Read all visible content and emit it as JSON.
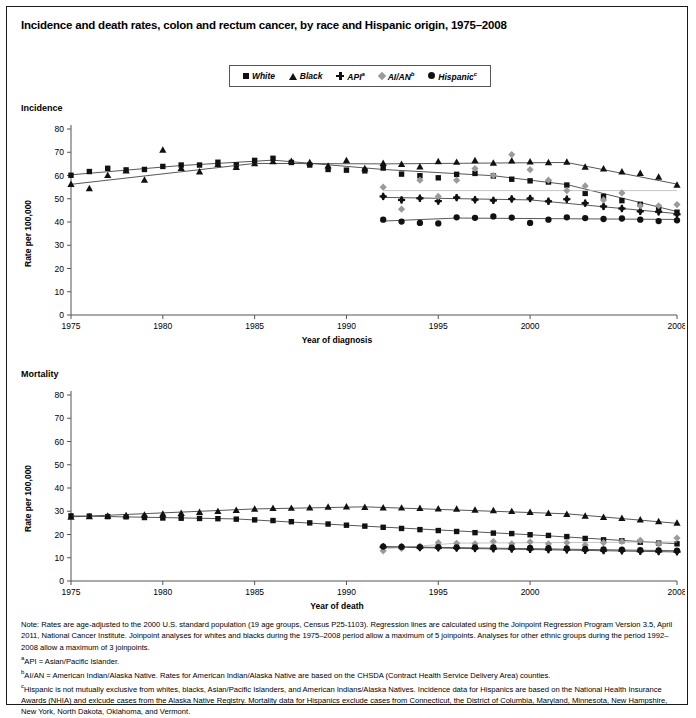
{
  "title": "Incidence and death rates, colon and rectum cancer, by race and Hispanic origin, 1975–2008",
  "legend": {
    "items": [
      {
        "label": "White",
        "sup": "",
        "marker": "square",
        "color": "#111111"
      },
      {
        "label": "Black",
        "sup": "",
        "marker": "triangle",
        "color": "#111111"
      },
      {
        "label": "API",
        "sup": "a",
        "marker": "plus",
        "color": "#111111"
      },
      {
        "label": "AI/AN",
        "sup": "b",
        "marker": "diamond",
        "color": "#9a9a9a"
      },
      {
        "label": "Hispanic",
        "sup": "c",
        "marker": "circle",
        "color": "#111111"
      }
    ]
  },
  "panels": {
    "incidence_label": "Incidence",
    "mortality_label": "Mortality",
    "ylabel": "Rate per 100,000",
    "xlabel_incidence": "Year of diagnosis",
    "xlabel_mortality": "Year of death"
  },
  "notes": {
    "note": "Note: Rates are age-adjusted to the 2000 U.S. standard population (19 age groups, Census P25-1103). Regression lines are calculated using the Joinpoint Regression Program Version 3.5, April 2011, National Cancer Institute. Joinpoint analyses for whites and blacks during the 1975–2008 period allow a maximum of 5 joinpoints. Analyses for other ethnic groups during the period 1992–2008 allow a maximum of 3 joinpoints.",
    "footnote_a_marker": "a",
    "footnote_a": "API = Asian/Pacific Islander.",
    "footnote_b_marker": "b",
    "footnote_b": "AI/AN = American Indian/Alaska Native. Rates for American Indian/Alaska Native are based on the CHSDA (Contract Health Service Delivery Area) counties.",
    "footnote_c_marker": "c",
    "footnote_c": "Hispanic is not mutually exclusive from whites, blacks, Asian/Pacific Islanders, and American Indians/Alaska Natives. Incidence data for Hispanics are based on the National Health Insurance Awards (NHIA) and exlcude cases from the Alaska Native Registry. Mortality data for Hispanics exclude cases from Connecticut, the District of Columbia, Maryland, Minnesota, New Hampshire, New York, North Dakota, Oklahoma, and Vermont."
  },
  "chart_data": [
    {
      "type": "line",
      "title": "Incidence",
      "xlabel": "Year of diagnosis",
      "ylabel": "Rate per 100,000",
      "xlim": [
        1975,
        2008
      ],
      "ylim": [
        0,
        80
      ],
      "yticks": [
        0,
        10,
        20,
        30,
        40,
        50,
        60,
        70,
        80
      ],
      "xticks": [
        1975,
        1980,
        1985,
        1990,
        1995,
        2000,
        2008
      ],
      "grid": false,
      "legend_position": "top-center",
      "series": [
        {
          "name": "White",
          "marker": "square",
          "color": "#111111",
          "x": [
            1975,
            1976,
            1977,
            1978,
            1979,
            1980,
            1981,
            1982,
            1983,
            1984,
            1985,
            1986,
            1987,
            1988,
            1989,
            1990,
            1991,
            1992,
            1993,
            1994,
            1995,
            1996,
            1997,
            1998,
            1999,
            2000,
            2001,
            2002,
            2003,
            2004,
            2005,
            2006,
            2007,
            2008
          ],
          "y": [
            60.1,
            61.7,
            63.1,
            62.4,
            62.6,
            63.9,
            64.5,
            64.5,
            65.7,
            64.6,
            66.5,
            67.4,
            65.6,
            64.5,
            62.6,
            62.3,
            62.0,
            63.2,
            60.6,
            59.9,
            59.0,
            60.5,
            60.9,
            59.8,
            58.4,
            57.7,
            57.2,
            55.9,
            52.3,
            51.0,
            49.2,
            47.6,
            46.0,
            44.2
          ],
          "fit": [
            [
              1975,
              60.3
            ],
            [
              1981,
              64.3
            ],
            [
              1986,
              66.6
            ],
            [
              1992,
              62.6
            ],
            [
              1998,
              59.9
            ],
            [
              2002,
              56.1
            ],
            [
              2008,
              44.5
            ]
          ]
        },
        {
          "name": "Black",
          "marker": "triangle",
          "color": "#111111",
          "x": [
            1975,
            1976,
            1977,
            1978,
            1979,
            1980,
            1981,
            1982,
            1983,
            1984,
            1985,
            1986,
            1987,
            1988,
            1989,
            1990,
            1991,
            1992,
            1993,
            1994,
            1995,
            1996,
            1997,
            1998,
            1999,
            2000,
            2001,
            2002,
            2003,
            2004,
            2005,
            2006,
            2007,
            2008
          ],
          "y": [
            56.3,
            54.5,
            60.1,
            62.1,
            58.1,
            71.0,
            63.2,
            61.7,
            64.9,
            63.6,
            65.2,
            66.1,
            66.2,
            65.6,
            64.2,
            66.5,
            63.1,
            65.3,
            64.9,
            63.8,
            66.1,
            65.8,
            66.5,
            65.4,
            66.4,
            66.0,
            65.6,
            65.9,
            63.7,
            63.0,
            61.7,
            61.0,
            59.4,
            56.0
          ],
          "fit": [
            [
              1975,
              56.2
            ],
            [
              1985,
              65.2
            ],
            [
              1992,
              65.0
            ],
            [
              2002,
              65.6
            ],
            [
              2008,
              56.3
            ]
          ]
        },
        {
          "name": "API",
          "marker": "plus",
          "color": "#111111",
          "x": [
            1992,
            1993,
            1994,
            1995,
            1996,
            1997,
            1998,
            1999,
            2000,
            2001,
            2002,
            2003,
            2004,
            2005,
            2006,
            2007,
            2008
          ],
          "y": [
            51.0,
            49.5,
            50.2,
            49.0,
            50.5,
            49.6,
            49.3,
            49.9,
            50.1,
            48.9,
            49.8,
            48.1,
            46.7,
            45.8,
            44.6,
            44.4,
            43.3
          ],
          "fit": [
            [
              1992,
              50.6
            ],
            [
              2000,
              49.5
            ],
            [
              2008,
              43.6
            ]
          ]
        },
        {
          "name": "AI/AN",
          "marker": "diamond",
          "color": "#9a9a9a",
          "x": [
            1992,
            1993,
            1994,
            1995,
            1996,
            1997,
            1998,
            1999,
            2000,
            2001,
            2002,
            2003,
            2004,
            2005,
            2006,
            2007,
            2008
          ],
          "y": [
            55.0,
            45.5,
            58.0,
            51.0,
            58.0,
            63.0,
            60.0,
            69.0,
            62.5,
            58.0,
            53.5,
            55.5,
            49.5,
            52.5,
            47.0,
            47.0,
            47.5
          ],
          "fit": [
            [
              1992,
              53.5
            ],
            [
              2008,
              53.5
            ]
          ]
        },
        {
          "name": "Hispanic",
          "marker": "circle",
          "color": "#111111",
          "x": [
            1992,
            1993,
            1994,
            1995,
            1996,
            1997,
            1998,
            1999,
            2000,
            2001,
            2002,
            2003,
            2004,
            2005,
            2006,
            2007,
            2008
          ],
          "y": [
            41.0,
            40.2,
            39.6,
            39.4,
            42.0,
            41.8,
            42.4,
            41.9,
            39.6,
            41.0,
            42.0,
            41.7,
            41.3,
            41.5,
            41.0,
            40.4,
            40.7
          ],
          "fit": [
            [
              1992,
              40.4
            ],
            [
              1996,
              41.7
            ],
            [
              2008,
              41.1
            ]
          ]
        }
      ]
    },
    {
      "type": "line",
      "title": "Mortality",
      "xlabel": "Year of death",
      "ylabel": "Rate per 100,000",
      "xlim": [
        1975,
        2008
      ],
      "ylim": [
        0,
        80
      ],
      "yticks": [
        0,
        10,
        20,
        30,
        40,
        50,
        60,
        70,
        80
      ],
      "xticks": [
        1975,
        1980,
        1985,
        1990,
        1995,
        2000,
        2008
      ],
      "grid": false,
      "legend_position": "top-center",
      "series": [
        {
          "name": "White",
          "marker": "square",
          "color": "#111111",
          "x": [
            1975,
            1976,
            1977,
            1978,
            1979,
            1980,
            1981,
            1982,
            1983,
            1984,
            1985,
            1986,
            1987,
            1988,
            1989,
            1990,
            1991,
            1992,
            1993,
            1994,
            1995,
            1996,
            1997,
            1998,
            1999,
            2000,
            2001,
            2002,
            2003,
            2004,
            2005,
            2006,
            2007,
            2008
          ],
          "y": [
            28.0,
            27.9,
            27.7,
            27.6,
            27.3,
            27.1,
            27.0,
            26.9,
            26.8,
            26.6,
            26.3,
            26.0,
            25.5,
            25.0,
            24.5,
            24.0,
            23.6,
            23.1,
            22.6,
            22.1,
            21.7,
            21.3,
            20.8,
            20.6,
            20.4,
            19.9,
            19.6,
            19.1,
            18.3,
            17.7,
            17.3,
            16.7,
            16.3,
            16.0
          ],
          "fit": [
            [
              1975,
              28.0
            ],
            [
              1984,
              26.7
            ],
            [
              1990,
              24.0
            ],
            [
              2000,
              19.9
            ],
            [
              2008,
              16.0
            ]
          ]
        },
        {
          "name": "Black",
          "marker": "triangle",
          "color": "#111111",
          "x": [
            1975,
            1976,
            1977,
            1978,
            1979,
            1980,
            1981,
            1982,
            1983,
            1984,
            1985,
            1986,
            1987,
            1988,
            1989,
            1990,
            1991,
            1992,
            1993,
            1994,
            1995,
            1996,
            1997,
            1998,
            1999,
            2000,
            2001,
            2002,
            2003,
            2004,
            2005,
            2006,
            2007,
            2008
          ],
          "y": [
            27.6,
            27.8,
            28.0,
            28.2,
            28.5,
            28.9,
            29.2,
            29.6,
            30.0,
            30.5,
            31.0,
            31.3,
            31.4,
            31.6,
            31.9,
            32.0,
            31.8,
            31.6,
            31.5,
            31.3,
            31.1,
            31.0,
            30.6,
            30.4,
            30.0,
            29.6,
            29.2,
            28.8,
            28.0,
            27.5,
            27.0,
            26.4,
            25.6,
            25.0
          ],
          "fit": [
            [
              1975,
              27.6
            ],
            [
              1985,
              31.0
            ],
            [
              1991,
              31.9
            ],
            [
              2002,
              28.9
            ],
            [
              2008,
              24.8
            ]
          ]
        },
        {
          "name": "API",
          "marker": "plus",
          "color": "#111111",
          "x": [
            1992,
            1993,
            1994,
            1995,
            1996,
            1997,
            1998,
            1999,
            2000,
            2001,
            2002,
            2003,
            2004,
            2005,
            2006,
            2007,
            2008
          ],
          "y": [
            14.6,
            14.5,
            14.4,
            14.3,
            14.2,
            14.0,
            13.9,
            13.8,
            13.6,
            13.5,
            13.4,
            13.2,
            13.1,
            13.0,
            12.8,
            12.7,
            12.6
          ],
          "fit": [
            [
              1992,
              14.6
            ],
            [
              2008,
              12.5
            ]
          ]
        },
        {
          "name": "AI/AN",
          "marker": "diamond",
          "color": "#9a9a9a",
          "x": [
            1992,
            1993,
            1994,
            1995,
            1996,
            1997,
            1998,
            1999,
            2000,
            2001,
            2002,
            2003,
            2004,
            2005,
            2006,
            2007,
            2008
          ],
          "y": [
            13.0,
            14.0,
            15.0,
            16.5,
            16.2,
            16.0,
            17.0,
            16.0,
            16.8,
            16.0,
            16.5,
            15.5,
            16.5,
            17.0,
            17.5,
            16.0,
            18.5
          ],
          "fit": [
            [
              1992,
              13.8
            ],
            [
              1996,
              16.3
            ],
            [
              2008,
              16.8
            ]
          ]
        },
        {
          "name": "Hispanic",
          "marker": "circle",
          "color": "#111111",
          "x": [
            1992,
            1993,
            1994,
            1995,
            1996,
            1997,
            1998,
            1999,
            2000,
            2001,
            2002,
            2003,
            2004,
            2005,
            2006,
            2007,
            2008
          ],
          "y": [
            14.8,
            14.7,
            14.6,
            14.6,
            14.5,
            14.5,
            14.4,
            14.3,
            14.2,
            14.1,
            14.0,
            13.8,
            13.6,
            13.5,
            13.3,
            13.2,
            13.1
          ],
          "fit": [
            [
              1992,
              14.8
            ],
            [
              2008,
              13.0
            ]
          ]
        }
      ]
    }
  ]
}
